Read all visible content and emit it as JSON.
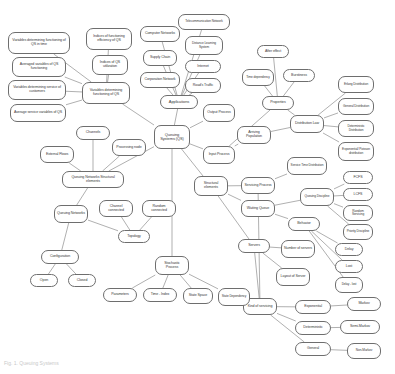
{
  "diagram": {
    "caption": "Fig. 1. Queuing Systems",
    "node_stroke": "#6e6e6e",
    "node_fill": "#ffffff",
    "text_color": "#3a3a3a",
    "edge_color": "#7a7a7a",
    "nodes": [
      {
        "id": "vars_time",
        "label": "Variables determining functioning of QS in time",
        "x": 8,
        "y": 32,
        "w": 62,
        "h": 22,
        "size": "n-xs"
      },
      {
        "id": "avg_vars",
        "label": "Averaged variables of QS functioning",
        "x": 12,
        "y": 57,
        "w": 54,
        "h": 20,
        "size": "n-xs"
      },
      {
        "id": "vars_service",
        "label": "Variables determining service of customers",
        "x": 8,
        "y": 80,
        "w": 58,
        "h": 20,
        "size": "n-xs"
      },
      {
        "id": "avg_service",
        "label": "Average service variables of QS",
        "x": 10,
        "y": 104,
        "w": 56,
        "h": 18,
        "size": "n-xs"
      },
      {
        "id": "indices_eff",
        "label": "Indices of functioning efficiency of QS",
        "x": 86,
        "y": 28,
        "w": 46,
        "h": 22,
        "size": "n-xs"
      },
      {
        "id": "indices_util",
        "label": "Indices of QS utilization",
        "x": 92,
        "y": 55,
        "w": 36,
        "h": 20,
        "size": "n-xs"
      },
      {
        "id": "vars_det",
        "label": "Variables determining functioning of QS",
        "x": 82,
        "y": 82,
        "w": 48,
        "h": 22,
        "size": "n-xs"
      },
      {
        "id": "comp_net",
        "label": "Computer Networks",
        "x": 140,
        "y": 26,
        "w": 40,
        "h": 16,
        "size": "n-xs"
      },
      {
        "id": "supply",
        "label": "Supply Chain",
        "x": 143,
        "y": 50,
        "w": 34,
        "h": 16,
        "size": "n-xs"
      },
      {
        "id": "corp_net",
        "label": "Corporation Network",
        "x": 140,
        "y": 72,
        "w": 40,
        "h": 16,
        "size": "n-xs"
      },
      {
        "id": "telecom",
        "label": "Telecommunication Network",
        "x": 178,
        "y": 14,
        "w": 52,
        "h": 16,
        "size": "n-xxs"
      },
      {
        "id": "dls",
        "label": "Distance Learning System",
        "x": 185,
        "y": 36,
        "w": 38,
        "h": 19,
        "size": "n-xxs"
      },
      {
        "id": "internet",
        "label": "Internet",
        "x": 185,
        "y": 60,
        "w": 36,
        "h": 13,
        "size": "n-xs"
      },
      {
        "id": "roads",
        "label": "Road's Traffic",
        "x": 185,
        "y": 78,
        "w": 36,
        "h": 15,
        "size": "n-xs"
      },
      {
        "id": "apps",
        "label": "Applications",
        "x": 160,
        "y": 95,
        "w": 38,
        "h": 14,
        "size": "n-s"
      },
      {
        "id": "qs",
        "label": "Queuing Systems (QS)",
        "x": 154,
        "y": 125,
        "w": 36,
        "h": 24,
        "size": "n-s"
      },
      {
        "id": "output_proc",
        "label": "Output Process",
        "x": 203,
        "y": 104,
        "w": 32,
        "h": 18,
        "size": "n-xs"
      },
      {
        "id": "input_proc",
        "label": "Input Process",
        "x": 203,
        "y": 146,
        "w": 32,
        "h": 18,
        "size": "n-xs"
      },
      {
        "id": "arriving_pop",
        "label": "Arriving Population",
        "x": 237,
        "y": 126,
        "w": 34,
        "h": 18,
        "size": "n-xs"
      },
      {
        "id": "after_effect",
        "label": "After effect",
        "x": 257,
        "y": 45,
        "w": 32,
        "h": 13,
        "size": "n-xs"
      },
      {
        "id": "time_dep",
        "label": "Time dependency",
        "x": 242,
        "y": 69,
        "w": 32,
        "h": 17,
        "size": "n-xxs"
      },
      {
        "id": "burstiness",
        "label": "Burstiness",
        "x": 283,
        "y": 69,
        "w": 32,
        "h": 13,
        "size": "n-xs"
      },
      {
        "id": "properties",
        "label": "Properties",
        "x": 262,
        "y": 96,
        "w": 32,
        "h": 14,
        "size": "n-xs"
      },
      {
        "id": "dist_law",
        "label": "Distribution Law",
        "x": 290,
        "y": 115,
        "w": 34,
        "h": 18,
        "size": "n-xs"
      },
      {
        "id": "erlang",
        "label": "Erlang Distribution",
        "x": 338,
        "y": 76,
        "w": 36,
        "h": 17,
        "size": "n-xxs"
      },
      {
        "id": "general_d",
        "label": "General Distribution",
        "x": 338,
        "y": 98,
        "w": 36,
        "h": 17,
        "size": "n-xxs"
      },
      {
        "id": "determ_d",
        "label": "Deterministic Distribution",
        "x": 338,
        "y": 120,
        "w": 36,
        "h": 17,
        "size": "n-xxs"
      },
      {
        "id": "exp_poisson",
        "label": "Exponential/ Poisson distribution",
        "x": 338,
        "y": 142,
        "w": 36,
        "h": 19,
        "size": "n-xxs"
      },
      {
        "id": "service_time",
        "label": "Service Time Distribution",
        "x": 287,
        "y": 157,
        "w": 40,
        "h": 18,
        "size": "n-xxs"
      },
      {
        "id": "queue_disc",
        "label": "Queuing Discipline",
        "x": 300,
        "y": 188,
        "w": 34,
        "h": 18,
        "size": "n-xxs"
      },
      {
        "id": "fcfs",
        "label": "FCFS",
        "x": 343,
        "y": 171,
        "w": 30,
        "h": 13,
        "size": "n-xs"
      },
      {
        "id": "lcfs",
        "label": "LCFS",
        "x": 343,
        "y": 188,
        "w": 30,
        "h": 13,
        "size": "n-xs"
      },
      {
        "id": "random_serv",
        "label": "Random Servicing",
        "x": 343,
        "y": 205,
        "w": 30,
        "h": 16,
        "size": "n-xxs"
      },
      {
        "id": "priority_disc",
        "label": "Priority Discipline",
        "x": 343,
        "y": 224,
        "w": 30,
        "h": 16,
        "size": "n-xxs"
      },
      {
        "id": "behavior",
        "label": "Behavior",
        "x": 288,
        "y": 217,
        "w": 32,
        "h": 14,
        "size": "n-xs"
      },
      {
        "id": "delay",
        "label": "Delay",
        "x": 335,
        "y": 243,
        "w": 28,
        "h": 13,
        "size": "n-xs"
      },
      {
        "id": "lost",
        "label": "Lost",
        "x": 335,
        "y": 260,
        "w": 28,
        "h": 13,
        "size": "n-xs"
      },
      {
        "id": "delay_lost",
        "label": "Delay - lost",
        "x": 335,
        "y": 277,
        "w": 28,
        "h": 16,
        "size": "n-xxs"
      },
      {
        "id": "struct_el",
        "label": "Structural elements",
        "x": 194,
        "y": 176,
        "w": 34,
        "h": 20,
        "size": "n-xs"
      },
      {
        "id": "servicing_proc",
        "label": "Servicing Process",
        "x": 241,
        "y": 177,
        "w": 34,
        "h": 17,
        "size": "n-xs"
      },
      {
        "id": "waiting_queue",
        "label": "Waiting Queue",
        "x": 241,
        "y": 200,
        "w": 34,
        "h": 17,
        "size": "n-xs"
      },
      {
        "id": "servers",
        "label": "Servers",
        "x": 238,
        "y": 239,
        "w": 32,
        "h": 14,
        "size": "n-xs"
      },
      {
        "id": "num_servers",
        "label": "Number of servers",
        "x": 281,
        "y": 240,
        "w": 34,
        "h": 18,
        "size": "n-xs"
      },
      {
        "id": "layout_server",
        "label": "Layout of Server",
        "x": 276,
        "y": 268,
        "w": 34,
        "h": 18,
        "size": "n-xs"
      },
      {
        "id": "kind_serv",
        "label": "Kind of servicing",
        "x": 243,
        "y": 298,
        "w": 34,
        "h": 17,
        "size": "n-xs"
      },
      {
        "id": "exponential",
        "label": "Exponential",
        "x": 295,
        "y": 300,
        "w": 36,
        "h": 14,
        "size": "n-xs"
      },
      {
        "id": "deterministic",
        "label": "Deterministic",
        "x": 295,
        "y": 321,
        "w": 36,
        "h": 14,
        "size": "n-xs"
      },
      {
        "id": "general_k",
        "label": "General",
        "x": 295,
        "y": 342,
        "w": 36,
        "h": 14,
        "size": "n-xs"
      },
      {
        "id": "markov",
        "label": "Markov",
        "x": 347,
        "y": 297,
        "w": 34,
        "h": 14,
        "size": "n-xs"
      },
      {
        "id": "semi_markov",
        "label": "Semi-Markov",
        "x": 340,
        "y": 320,
        "w": 40,
        "h": 14,
        "size": "n-xs"
      },
      {
        "id": "non_markov",
        "label": "Non-Markov",
        "x": 347,
        "y": 343,
        "w": 34,
        "h": 16,
        "size": "n-xxs"
      },
      {
        "id": "channels",
        "label": "Channels",
        "x": 76,
        "y": 126,
        "w": 34,
        "h": 14,
        "size": "n-xs"
      },
      {
        "id": "ext_flows",
        "label": "External Flows",
        "x": 40,
        "y": 146,
        "w": 34,
        "h": 17,
        "size": "n-xs"
      },
      {
        "id": "proc_node",
        "label": "Processing node",
        "x": 112,
        "y": 139,
        "w": 34,
        "h": 17,
        "size": "n-xs"
      },
      {
        "id": "qn_struct",
        "label": "Queuing Networks Structural elements",
        "x": 62,
        "y": 171,
        "w": 62,
        "h": 17,
        "size": "n-xs"
      },
      {
        "id": "queuing_nets",
        "label": "Queuing Networks",
        "x": 54,
        "y": 205,
        "w": 34,
        "h": 18,
        "size": "n-xs"
      },
      {
        "id": "channel_conn",
        "label": "Channel connected",
        "x": 99,
        "y": 200,
        "w": 34,
        "h": 17,
        "size": "n-xs"
      },
      {
        "id": "random_conn",
        "label": "Random connected",
        "x": 142,
        "y": 200,
        "w": 34,
        "h": 17,
        "size": "n-xs"
      },
      {
        "id": "topology",
        "label": "Topology",
        "x": 118,
        "y": 230,
        "w": 32,
        "h": 13,
        "size": "n-xs"
      },
      {
        "id": "configuration",
        "label": "Configuration",
        "x": 41,
        "y": 250,
        "w": 38,
        "h": 14,
        "size": "n-xs"
      },
      {
        "id": "open",
        "label": "Open",
        "x": 30,
        "y": 274,
        "w": 28,
        "h": 13,
        "size": "n-xs"
      },
      {
        "id": "closed",
        "label": "Closed",
        "x": 68,
        "y": 274,
        "w": 28,
        "h": 13,
        "size": "n-xs"
      },
      {
        "id": "stoch_proc",
        "label": "Stochastic Process",
        "x": 155,
        "y": 256,
        "w": 34,
        "h": 19,
        "size": "n-xs"
      },
      {
        "id": "parameters",
        "label": "Parameters",
        "x": 103,
        "y": 288,
        "w": 34,
        "h": 14,
        "size": "n-xs"
      },
      {
        "id": "time_index",
        "label": "Time - Index",
        "x": 143,
        "y": 288,
        "w": 34,
        "h": 14,
        "size": "n-xs"
      },
      {
        "id": "state_space",
        "label": "State Space",
        "x": 183,
        "y": 288,
        "w": 30,
        "h": 16,
        "size": "n-xs"
      },
      {
        "id": "state_dep",
        "label": "State Dependency",
        "x": 218,
        "y": 288,
        "w": 32,
        "h": 18,
        "size": "n-xxs"
      }
    ],
    "edges": [
      [
        "vars_time",
        "vars_det"
      ],
      [
        "avg_vars",
        "vars_det"
      ],
      [
        "vars_service",
        "vars_det"
      ],
      [
        "avg_service",
        "vars_det"
      ],
      [
        "indices_eff",
        "vars_det"
      ],
      [
        "indices_util",
        "vars_det"
      ],
      [
        "vars_det",
        "qs"
      ],
      [
        "comp_net",
        "apps"
      ],
      [
        "supply",
        "apps"
      ],
      [
        "corp_net",
        "apps"
      ],
      [
        "telecom",
        "apps"
      ],
      [
        "dls",
        "apps"
      ],
      [
        "internet",
        "apps"
      ],
      [
        "roads",
        "apps"
      ],
      [
        "apps",
        "qs"
      ],
      [
        "qs",
        "output_proc"
      ],
      [
        "qs",
        "input_proc"
      ],
      [
        "qs",
        "struct_el"
      ],
      [
        "qs",
        "stoch_proc"
      ],
      [
        "qs",
        "qn_struct"
      ],
      [
        "input_proc",
        "arriving_pop"
      ],
      [
        "input_proc",
        "properties"
      ],
      [
        "arriving_pop",
        "dist_law"
      ],
      [
        "after_effect",
        "properties"
      ],
      [
        "time_dep",
        "properties"
      ],
      [
        "burstiness",
        "properties"
      ],
      [
        "properties",
        "dist_law"
      ],
      [
        "dist_law",
        "erlang"
      ],
      [
        "dist_law",
        "general_d"
      ],
      [
        "dist_law",
        "determ_d"
      ],
      [
        "dist_law",
        "exp_poisson"
      ],
      [
        "struct_el",
        "servicing_proc"
      ],
      [
        "struct_el",
        "waiting_queue"
      ],
      [
        "struct_el",
        "servers"
      ],
      [
        "servicing_proc",
        "service_time"
      ],
      [
        "servicing_proc",
        "kind_serv"
      ],
      [
        "waiting_queue",
        "queue_disc"
      ],
      [
        "waiting_queue",
        "behavior"
      ],
      [
        "queue_disc",
        "fcfs"
      ],
      [
        "queue_disc",
        "lcfs"
      ],
      [
        "queue_disc",
        "random_serv"
      ],
      [
        "queue_disc",
        "priority_disc"
      ],
      [
        "behavior",
        "delay"
      ],
      [
        "behavior",
        "lost"
      ],
      [
        "behavior",
        "delay_lost"
      ],
      [
        "servers",
        "num_servers"
      ],
      [
        "servers",
        "layout_server"
      ],
      [
        "servers",
        "kind_serv"
      ],
      [
        "kind_serv",
        "exponential"
      ],
      [
        "kind_serv",
        "deterministic"
      ],
      [
        "kind_serv",
        "general_k"
      ],
      [
        "exponential",
        "markov"
      ],
      [
        "deterministic",
        "semi_markov"
      ],
      [
        "general_k",
        "non_markov"
      ],
      [
        "channels",
        "qn_struct"
      ],
      [
        "ext_flows",
        "qn_struct"
      ],
      [
        "proc_node",
        "qn_struct"
      ],
      [
        "qn_struct",
        "queuing_nets"
      ],
      [
        "queuing_nets",
        "topology"
      ],
      [
        "queuing_nets",
        "configuration"
      ],
      [
        "channel_conn",
        "topology"
      ],
      [
        "random_conn",
        "topology"
      ],
      [
        "configuration",
        "open"
      ],
      [
        "configuration",
        "closed"
      ],
      [
        "stoch_proc",
        "parameters"
      ],
      [
        "stoch_proc",
        "time_index"
      ],
      [
        "stoch_proc",
        "state_space"
      ],
      [
        "stoch_proc",
        "state_dep"
      ]
    ]
  }
}
